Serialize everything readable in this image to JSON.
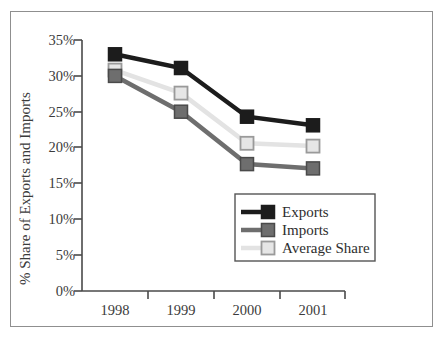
{
  "figure": {
    "background_color": "#ffffff",
    "frame_color": "#8f8f8f"
  },
  "chart_data": {
    "type": "line",
    "title": "",
    "subtitle": "",
    "xlabel": "",
    "ylabel": "% Share of Exports and Imports",
    "categories": [
      "1998",
      "1999",
      "2000",
      "2001"
    ],
    "x_tick_labels": [
      "1998",
      "1999",
      "2000",
      "2001"
    ],
    "y_tick_labels": [
      "0%",
      "5%",
      "10%",
      "15%",
      "20%",
      "25%",
      "30%",
      "35%"
    ],
    "y_tick_values": [
      0,
      5,
      10,
      15,
      20,
      25,
      30,
      35
    ],
    "ylim": [
      0,
      35
    ],
    "grid": false,
    "legend_position": "lower right inside",
    "series": [
      {
        "name": "Exports",
        "color": "#1c1c1c",
        "marker": "filled-square",
        "marker_fill": "#1c1c1c",
        "marker_edge": "#1c1c1c",
        "values": [
          33.0,
          31.1,
          24.3,
          23.1
        ]
      },
      {
        "name": "Imports",
        "color": "#6e6e6e",
        "marker": "filled-square",
        "marker_fill": "#6e6e6e",
        "marker_edge": "#4a4a4a",
        "values": [
          30.0,
          25.0,
          17.7,
          17.1
        ]
      },
      {
        "name": "Average Share",
        "color": "#e3e3e3",
        "marker": "open-square",
        "marker_fill": "#e6e6e6",
        "marker_edge": "#9a9a9a",
        "values": [
          30.8,
          27.6,
          20.6,
          20.2
        ]
      }
    ],
    "legend_entries": [
      {
        "label": "Exports",
        "color": "#1c1c1c",
        "marker_fill": "#1c1c1c",
        "marker_edge": "#1c1c1c"
      },
      {
        "label": "Imports",
        "color": "#6e6e6e",
        "marker_fill": "#6e6e6e",
        "marker_edge": "#4a4a4a"
      },
      {
        "label": "Average Share",
        "color": "#e3e3e3",
        "marker_fill": "#e6e6e6",
        "marker_edge": "#9a9a9a"
      }
    ]
  }
}
